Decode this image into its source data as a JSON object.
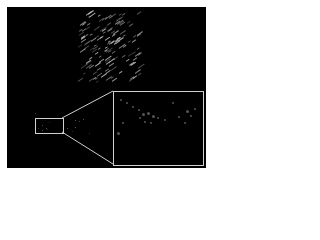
{
  "figure": {
    "background_color": "#000000",
    "outline_color": "#cfcfcf",
    "source_region": {
      "x": 35,
      "y": 118,
      "w": 27,
      "h": 14
    },
    "inset_region": {
      "x": 113,
      "y": 91,
      "w": 89,
      "h": 73
    },
    "streak_cloud": {
      "x": 78,
      "y": 14,
      "w": 62,
      "h": 68
    }
  }
}
